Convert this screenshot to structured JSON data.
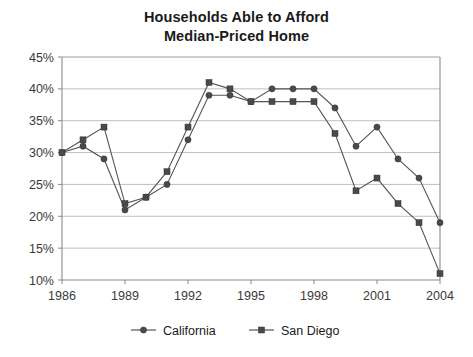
{
  "chart_data": {
    "type": "line",
    "title": "Households Able to Afford Median-Priced Home",
    "title_line1": "Households Able to Afford",
    "title_line2": "Median-Priced Home",
    "xlabel": "",
    "ylabel": "",
    "x": [
      1986,
      1987,
      1988,
      1989,
      1990,
      1991,
      1992,
      1993,
      1994,
      1995,
      1996,
      1997,
      1998,
      1999,
      2000,
      2001,
      2002,
      2003,
      2004
    ],
    "categories": [
      "1986",
      "1987",
      "1988",
      "1989",
      "1990",
      "1991",
      "1992",
      "1993",
      "1994",
      "1995",
      "1996",
      "1997",
      "1998",
      "1999",
      "2000",
      "2001",
      "2002",
      "2003",
      "2004"
    ],
    "series": [
      {
        "name": "California",
        "marker": "circle",
        "color": "#4a4a4a",
        "values": [
          30,
          31,
          29,
          21,
          23,
          25,
          32,
          39,
          39,
          38,
          40,
          40,
          40,
          37,
          31,
          34,
          29,
          26,
          19
        ]
      },
      {
        "name": "San Diego",
        "marker": "square",
        "color": "#4a4a4a",
        "values": [
          30,
          32,
          34,
          22,
          23,
          27,
          34,
          41,
          40,
          38,
          38,
          38,
          38,
          33,
          24,
          26,
          22,
          19,
          11
        ]
      }
    ],
    "ylim": [
      10,
      45
    ],
    "ytick_values": [
      10,
      15,
      20,
      25,
      30,
      35,
      40,
      45
    ],
    "ytick_labels": [
      "10%",
      "15%",
      "20%",
      "25%",
      "30%",
      "35%",
      "40%",
      "45%"
    ],
    "xlim": [
      1986,
      2004
    ],
    "xtick_values": [
      1986,
      1989,
      1992,
      1995,
      1998,
      2001,
      2004
    ],
    "xtick_labels": [
      "1986",
      "1989",
      "1992",
      "1995",
      "1998",
      "2001",
      "2004"
    ],
    "grid": "horizontal",
    "legend_position": "bottom",
    "legend_entries": [
      "California",
      "San Diego"
    ]
  }
}
